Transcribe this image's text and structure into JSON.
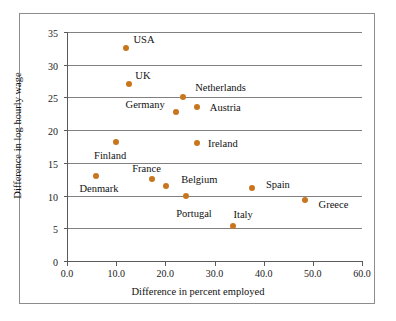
{
  "chart_data": {
    "type": "scatter",
    "title": "",
    "xlabel": "Difference in percent employed",
    "ylabel": "Difference in log hourly wage",
    "xlim": [
      0.0,
      60.0
    ],
    "ylim": [
      0,
      35
    ],
    "xticks": [
      "0.0",
      "10.0",
      "20.0",
      "30.0",
      "40.0",
      "50.0",
      "60.0"
    ],
    "xtick_values": [
      0,
      10,
      20,
      30,
      40,
      50,
      60
    ],
    "yticks": [
      "0",
      "5",
      "10",
      "15",
      "20",
      "25",
      "30",
      "35"
    ],
    "ytick_values": [
      0,
      5,
      10,
      15,
      20,
      25,
      30,
      35
    ],
    "grid": "horizontal",
    "legend": "none",
    "marker_color": "#c8761e",
    "points": [
      {
        "label": "USA",
        "x": 12.0,
        "y": 32.5,
        "label_dx": 18,
        "label_dy": -9
      },
      {
        "label": "UK",
        "x": 12.6,
        "y": 27.1,
        "label_dx": 14,
        "label_dy": -9
      },
      {
        "label": "Netherlands",
        "x": 23.5,
        "y": 25.0,
        "label_dx": 38,
        "label_dy": -10
      },
      {
        "label": "Austria",
        "x": 26.5,
        "y": 23.6,
        "label_dx": 28,
        "label_dy": 0
      },
      {
        "label": "Germany",
        "x": 22.2,
        "y": 22.7,
        "label_dx": -31,
        "label_dy": -8
      },
      {
        "label": "Ireland",
        "x": 26.4,
        "y": 18.0,
        "label_dx": 26,
        "label_dy": 0
      },
      {
        "label": "Finland",
        "x": 10.0,
        "y": 18.2,
        "label_dx": -6,
        "label_dy": 13
      },
      {
        "label": "France",
        "x": 17.2,
        "y": 12.6,
        "label_dx": -5,
        "label_dy": -11
      },
      {
        "label": "Belgium",
        "x": 20.2,
        "y": 11.4,
        "label_dx": 33,
        "label_dy": -7
      },
      {
        "label": "Denmark",
        "x": 5.9,
        "y": 13.0,
        "label_dx": 3,
        "label_dy": 12
      },
      {
        "label": "Portugal",
        "x": 24.2,
        "y": 9.9,
        "label_dx": 8,
        "label_dy": 17
      },
      {
        "label": "Spain",
        "x": 37.6,
        "y": 11.1,
        "label_dx": 26,
        "label_dy": -4
      },
      {
        "label": "Italy",
        "x": 33.8,
        "y": 5.4,
        "label_dx": 10,
        "label_dy": -12
      },
      {
        "label": "Greece",
        "x": 48.5,
        "y": 9.3,
        "label_dx": 28,
        "label_dy": 4
      }
    ]
  }
}
